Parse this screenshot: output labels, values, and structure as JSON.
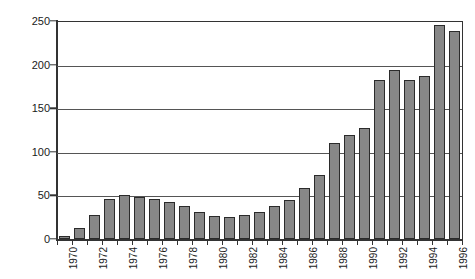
{
  "chart_data": {
    "type": "bar",
    "title": "",
    "subtitle": "",
    "xlabel": "",
    "ylabel": "",
    "categories": [
      "1970",
      "1971",
      "1972",
      "1973",
      "1974",
      "1975",
      "1976",
      "1977",
      "1978",
      "1979",
      "1980",
      "1981",
      "1982",
      "1983",
      "1984",
      "1985",
      "1986",
      "1987",
      "1988",
      "1989",
      "1990",
      "1991",
      "1992",
      "1993",
      "1994",
      "1995",
      "1996"
    ],
    "values": [
      3,
      13,
      28,
      46,
      51,
      48,
      46,
      43,
      38,
      31,
      26,
      25,
      27,
      31,
      38,
      45,
      59,
      73,
      110,
      119,
      127,
      182,
      194,
      182,
      187,
      245,
      238
    ],
    "xtick_labels": [
      "1970",
      "1972",
      "1974",
      "1976",
      "1978",
      "1980",
      "1982",
      "1984",
      "1986",
      "1988",
      "1990",
      "1992",
      "1994",
      "1996"
    ],
    "ytick_labels": [
      "0",
      "50",
      "100",
      "150",
      "200",
      "250"
    ],
    "ytick_values": [
      0,
      50,
      100,
      150,
      200,
      250
    ],
    "ylim": [
      0,
      250
    ],
    "grid": true,
    "legend": false,
    "legend_position": "none",
    "bar_color": "#878787",
    "bar_edge_color": "#2b2b2b",
    "axis_color": "#333333",
    "grid_color": "#555555",
    "background_color": "#ffffff"
  }
}
